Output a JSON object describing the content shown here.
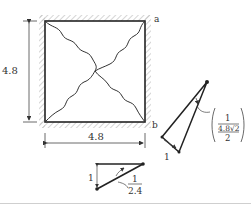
{
  "diagram": {
    "square": {
      "width_label": "4.8",
      "height_label": "4.8",
      "corner_a": "a",
      "corner_b": "b"
    },
    "triangle_right": {
      "short_side_label": "1",
      "fraction": {
        "numerator": "1",
        "denominator_top": "4.8√2",
        "denominator_bottom": "2"
      }
    },
    "triangle_bottom": {
      "vertical_label": "1",
      "fraction": {
        "numerator": "1",
        "denominator": "2.4"
      }
    },
    "colors": {
      "line": "#222222",
      "hatch": "#b8b8b8",
      "text": "#333333"
    }
  }
}
